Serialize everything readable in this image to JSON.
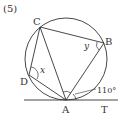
{
  "problem_number": "(5)",
  "diagram": {
    "type": "circle-inscribed-quadrilateral-with-tangent",
    "circle": {
      "cx": 66,
      "cy": 59,
      "r": 41
    },
    "points": {
      "C": {
        "label": "C",
        "x": 40,
        "y": 27
      },
      "B": {
        "label": "B",
        "x": 104,
        "y": 43
      },
      "D": {
        "label": "D",
        "x": 29,
        "y": 75
      },
      "A": {
        "label": "A",
        "x": 66,
        "y": 100
      },
      "T": {
        "label": "T"
      }
    },
    "angle_labels": {
      "x": "x",
      "y": "y",
      "given": "110°"
    },
    "colors": {
      "stroke": "#333333",
      "background": "#ffffff"
    }
  }
}
